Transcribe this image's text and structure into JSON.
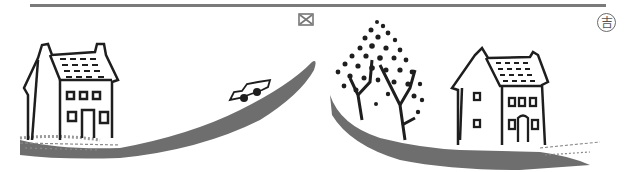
{
  "header": {
    "rule_color": "#7a7a7a",
    "marker_icon": "crossed-box-icon",
    "badge_char": "吉",
    "badge_icon": "circled-kichi-icon"
  },
  "illustration": {
    "style": "ink woodcut",
    "ink_color": "#1e1e1e",
    "road_color": "#6e6e6e",
    "elements": [
      {
        "name": "left-house",
        "windows_upper": 3,
        "windows_lower": 2,
        "door": true
      },
      {
        "name": "road-left-ascending"
      },
      {
        "name": "car",
        "on": "road-left-ascending"
      },
      {
        "name": "tree",
        "leaves": "dotted"
      },
      {
        "name": "road-right-descending"
      },
      {
        "name": "right-house",
        "windows_upper": 3,
        "windows_lower": 2,
        "door": true,
        "side_windows": 2
      }
    ]
  }
}
